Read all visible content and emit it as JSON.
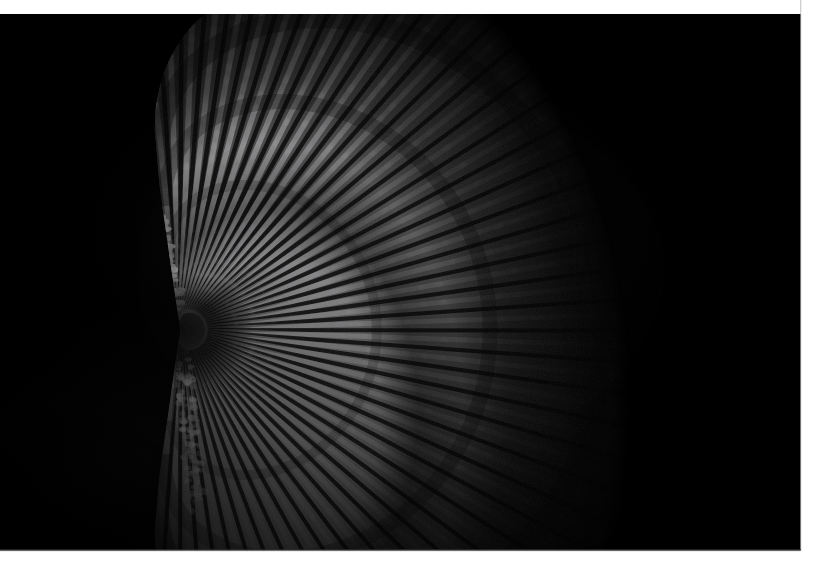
{
  "image": {
    "kind": "photograph",
    "subject_name": "scallop-shell",
    "subject_description": "Fan-shaped bivalve scallop shell, valve exterior facing the camera",
    "orientation": "hinge at left, fan opening to the right",
    "treatment": "black and white, high contrast, dark field",
    "background_color": "#000000",
    "border_color": "#ffffff",
    "alt_text": "High-contrast black-and-white photograph of a scallop shell on a pure black background, its radiating ribs catching light from the upper left"
  },
  "canvas": {
    "width_px": 819,
    "height_px": 576,
    "photo_left_px": 0,
    "photo_top_px": 14,
    "photo_width_px": 801,
    "photo_height_px": 537
  },
  "borders": {
    "top_height_px": 14,
    "bottom_height_px": 25,
    "right_width_px": 18,
    "left_width_px": 0,
    "color": "#ffffff"
  },
  "subject_geometry": {
    "umbo_x_px": 180,
    "umbo_y_px": 330,
    "fan_extent_right_px": 668,
    "fan_extent_top_px": 52,
    "fan_extent_bottom_px": 512,
    "rib_count": 48,
    "fan_sweep_degrees": 196,
    "fan_start_angle_degrees": -98,
    "outer_radius_px": 492,
    "upper_auricle_tip_x_px": 156,
    "upper_auricle_tip_y_px": 214,
    "lower_auricle_tip_x_px": 196,
    "lower_auricle_tip_y_px": 500
  },
  "tones": {
    "highlight": "#f2f2f2",
    "midtone": "#9a9a9a",
    "shadow": "#2a2a2a",
    "deep_shadow": "#0b0b0b",
    "black_point": "#000000",
    "white_point": "#ffffff"
  },
  "lighting": {
    "key_light_direction": "upper-left",
    "key_light_angle_degrees": 315,
    "falloff": "strong, rapid toward lower right",
    "brightest_zone": "upper shell, between 11 and 1 o'clock from the umbo"
  },
  "texture": {
    "rib_type": "radial ribs with scaly imbricated scales",
    "rib_scale_rows": 26,
    "auricle_texture": "coarse nodular bumps",
    "growth_band_count": 3
  },
  "chart_data": null
}
